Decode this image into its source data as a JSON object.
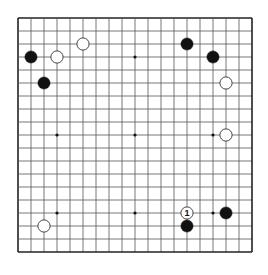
{
  "board": {
    "size": 19,
    "origin_x": 18,
    "origin_y": 18,
    "spacing": 13.0,
    "line_color": "#555555",
    "border_color": "#222222",
    "background": "#ffffff",
    "star_points": [
      [
        3,
        3
      ],
      [
        3,
        9
      ],
      [
        3,
        15
      ],
      [
        9,
        3
      ],
      [
        9,
        9
      ],
      [
        9,
        15
      ],
      [
        15,
        3
      ],
      [
        15,
        9
      ],
      [
        15,
        15
      ]
    ]
  },
  "stones": [
    {
      "color": "black",
      "col": 1,
      "row": 3,
      "label": ""
    },
    {
      "color": "white",
      "col": 3,
      "row": 3,
      "label": ""
    },
    {
      "color": "white",
      "col": 5,
      "row": 2,
      "label": ""
    },
    {
      "color": "black",
      "col": 2,
      "row": 5,
      "label": ""
    },
    {
      "color": "black",
      "col": 13,
      "row": 2,
      "label": ""
    },
    {
      "color": "black",
      "col": 15,
      "row": 3,
      "label": ""
    },
    {
      "color": "white",
      "col": 16,
      "row": 5,
      "label": ""
    },
    {
      "color": "white",
      "col": 16,
      "row": 9,
      "label": ""
    },
    {
      "color": "white",
      "col": 13,
      "row": 15,
      "label": "1"
    },
    {
      "color": "black",
      "col": 13,
      "row": 16,
      "label": ""
    },
    {
      "color": "black",
      "col": 16,
      "row": 15,
      "label": ""
    },
    {
      "color": "white",
      "col": 2,
      "row": 16,
      "label": ""
    }
  ],
  "colors": {
    "black_stone": "#111111",
    "white_stone": "#ffffff",
    "white_stone_outline": "#333333"
  }
}
